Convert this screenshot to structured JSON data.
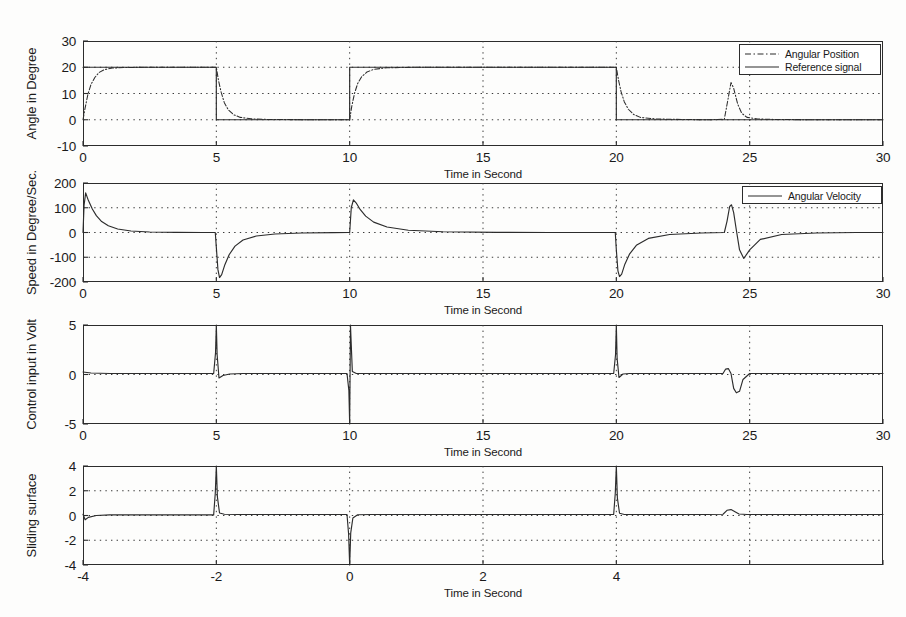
{
  "figure": {
    "background_color": "#fdfdfc",
    "line_color": "#2c2c2c",
    "grid_color": "#3a3a3a"
  },
  "chart_data": [
    {
      "id": "angular-position",
      "type": "line",
      "title": "",
      "xlabel": "Time in Second",
      "ylabel": "Angle in Degree",
      "xlim": [
        0,
        30
      ],
      "ylim": [
        -10,
        30
      ],
      "xticks": [
        0,
        5,
        10,
        15,
        20,
        25,
        30
      ],
      "yticks": [
        -10,
        0,
        10,
        20,
        30
      ],
      "xticklabels": [
        "0",
        "5",
        "10",
        "15",
        "20",
        "25",
        "30"
      ],
      "yticklabels": [
        "-10",
        "0",
        "10",
        "20",
        "30"
      ],
      "grid": true,
      "legend_position": "upper right",
      "series": [
        {
          "name": "Angular Position",
          "style": "dashdot",
          "x": [
            0,
            0.08,
            0.18,
            0.3,
            0.45,
            0.6,
            0.8,
            1.1,
            1.6,
            2.5,
            3.5,
            4.5,
            4.99,
            5.0,
            5.08,
            5.18,
            5.3,
            5.45,
            5.65,
            5.9,
            6.3,
            7.0,
            8.0,
            9.0,
            9.99,
            10.0,
            10.08,
            10.18,
            10.3,
            10.45,
            10.65,
            10.9,
            11.4,
            12.5,
            14.0,
            16.0,
            18.0,
            19.99,
            20.0,
            20.08,
            20.18,
            20.3,
            20.45,
            20.65,
            20.9,
            21.5,
            22.5,
            23.5,
            24.05,
            24.2,
            24.3,
            24.4,
            24.55,
            24.7,
            24.9,
            25.3,
            26.0,
            27.5,
            29.0,
            30.0
          ],
          "y": [
            0,
            4.5,
            9.5,
            13.5,
            16.2,
            18.0,
            19.1,
            19.7,
            19.9,
            20.0,
            20.0,
            20.0,
            20.0,
            20.0,
            15.0,
            10.5,
            6.5,
            3.8,
            1.9,
            0.9,
            0.35,
            0.1,
            0.05,
            0.0,
            0.0,
            0.0,
            5.2,
            10.0,
            13.8,
            16.4,
            18.2,
            19.2,
            19.8,
            20.0,
            20.0,
            20.0,
            20.0,
            20.0,
            20.0,
            15.2,
            10.6,
            6.8,
            4.0,
            2.0,
            0.9,
            0.3,
            0.1,
            0.0,
            0.2,
            8.5,
            14.2,
            12.0,
            6.0,
            2.5,
            0.9,
            0.3,
            0.1,
            0.0,
            0.0,
            0.0
          ]
        },
        {
          "name": "Reference signal",
          "style": "solid",
          "x": [
            0,
            4.999,
            5.0,
            9.999,
            10.0,
            19.999,
            20.0,
            30
          ],
          "y": [
            20,
            20,
            0,
            0,
            20,
            20,
            0,
            0
          ]
        }
      ]
    },
    {
      "id": "angular-velocity",
      "type": "line",
      "title": "",
      "xlabel": "Time in Second",
      "ylabel": "Speed in Degree/Sec.",
      "xlim": [
        0,
        30
      ],
      "ylim": [
        -200,
        200
      ],
      "xticks": [
        0,
        5,
        10,
        15,
        20,
        25,
        30
      ],
      "yticks": [
        -200,
        -100,
        0,
        100,
        200
      ],
      "xticklabels": [
        "0",
        "5",
        "10",
        "15",
        "20",
        "25",
        "30"
      ],
      "yticklabels": [
        "-200",
        "-100",
        "0",
        "100",
        "200"
      ],
      "grid": true,
      "legend_position": "upper right",
      "series": [
        {
          "name": "Angular Velocity",
          "style": "solid",
          "x": [
            0,
            0.04,
            0.1,
            0.2,
            0.35,
            0.5,
            0.7,
            0.95,
            1.3,
            1.8,
            2.5,
            3.5,
            4.5,
            4.96,
            5.0,
            5.06,
            5.12,
            5.2,
            5.32,
            5.48,
            5.7,
            6.0,
            6.5,
            7.2,
            8.2,
            9.4,
            9.96,
            10.0,
            10.06,
            10.14,
            10.24,
            10.4,
            10.6,
            10.9,
            11.4,
            12.2,
            13.5,
            15.5,
            17.5,
            19.5,
            19.96,
            20.0,
            20.06,
            20.12,
            20.2,
            20.32,
            20.5,
            20.75,
            21.2,
            22.0,
            23.2,
            24.05,
            24.15,
            24.25,
            24.32,
            24.4,
            24.5,
            24.62,
            24.78,
            25.0,
            25.4,
            26.2,
            27.5,
            29.0,
            30.0
          ],
          "y": [
            0,
            110,
            160,
            130,
            95,
            68,
            44,
            27,
            14,
            6,
            2,
            0.5,
            0,
            0,
            -60,
            -150,
            -182,
            -170,
            -130,
            -90,
            -55,
            -30,
            -14,
            -6,
            -2,
            -0.5,
            0,
            0,
            100,
            132,
            120,
            92,
            66,
            42,
            22,
            9,
            3,
            0.6,
            0,
            0,
            0,
            -70,
            -155,
            -178,
            -168,
            -128,
            -86,
            -52,
            -24,
            -8,
            -2,
            0,
            45,
            105,
            112,
            80,
            10,
            -70,
            -105,
            -70,
            -28,
            -8,
            -2,
            0,
            0
          ]
        }
      ]
    },
    {
      "id": "control-input",
      "type": "line",
      "title": "",
      "xlabel": "Time in Second",
      "ylabel": "Control input in Volt",
      "xlim": [
        0,
        30
      ],
      "ylim": [
        -5,
        5
      ],
      "xticks": [
        0,
        5,
        10,
        15,
        20,
        25,
        30
      ],
      "yticks": [
        -5,
        0,
        5
      ],
      "xticklabels": [
        "0",
        "5",
        "10",
        "15",
        "20",
        "25",
        "30"
      ],
      "yticklabels": [
        "-5",
        "0",
        "5"
      ],
      "grid": true,
      "legend_position": "none",
      "series": [
        {
          "name": "Control input",
          "style": "solid",
          "x": [
            0,
            0.3,
            1.0,
            2.0,
            3.0,
            4.0,
            4.9,
            4.97,
            5.0,
            5.03,
            5.1,
            5.25,
            5.5,
            6.0,
            7.0,
            8.5,
            9.9,
            9.97,
            10.0,
            10.03,
            10.1,
            10.25,
            10.5,
            11.0,
            12.5,
            15.0,
            17.5,
            19.9,
            19.97,
            20.0,
            20.03,
            20.1,
            20.25,
            20.5,
            21.0,
            22.0,
            23.2,
            24.0,
            24.1,
            24.2,
            24.3,
            24.4,
            24.5,
            24.62,
            24.75,
            25.0,
            25.5,
            26.5,
            28.0,
            30.0
          ],
          "y": [
            0.25,
            0.15,
            0.1,
            0.1,
            0.1,
            0.1,
            0.1,
            2.2,
            5.0,
            2.0,
            -0.35,
            -0.1,
            0.05,
            0.1,
            0.1,
            0.1,
            0.1,
            -1.6,
            -5.0,
            5.0,
            0.3,
            0.1,
            0.1,
            0.1,
            0.1,
            0.1,
            0.1,
            0.1,
            2.0,
            5.0,
            1.6,
            -0.3,
            0.05,
            0.1,
            0.1,
            0.1,
            0.1,
            0.1,
            0.55,
            0.6,
            0.1,
            -1.4,
            -1.85,
            -1.7,
            -0.5,
            0.1,
            0.1,
            0.1,
            0.1,
            0.1
          ]
        }
      ]
    },
    {
      "id": "sliding-surface",
      "type": "line",
      "title": "",
      "xlabel": "Time in Second",
      "ylabel": "Sliding surface",
      "xlim": [
        0,
        30
      ],
      "ylim": [
        -4,
        4
      ],
      "xticks": [
        0,
        5,
        10,
        15,
        20,
        25,
        30
      ],
      "yticks": [
        -4,
        -2,
        0,
        2,
        4
      ],
      "xticklabels": [
        "-4",
        "-2",
        "0",
        "2",
        "4"
      ],
      "yticklabels": [
        "-4",
        "-2",
        "0",
        "2",
        "4"
      ],
      "grid": true,
      "legend_position": "none",
      "series": [
        {
          "name": "Sliding surface",
          "style": "solid",
          "x": [
            0,
            0.08,
            0.2,
            0.5,
            1.0,
            2.0,
            3.0,
            4.0,
            4.9,
            4.96,
            5.0,
            5.04,
            5.12,
            5.3,
            5.8,
            7.0,
            8.5,
            9.9,
            9.96,
            10.0,
            10.04,
            10.12,
            10.3,
            10.8,
            12.0,
            14.0,
            16.0,
            18.0,
            19.9,
            19.96,
            20.0,
            20.04,
            20.12,
            20.3,
            20.8,
            22.0,
            23.4,
            24.0,
            24.15,
            24.3,
            24.45,
            24.6,
            24.9,
            25.5,
            26.5,
            28.0,
            30.0
          ],
          "y": [
            0.1,
            -0.35,
            -0.15,
            0.0,
            0.05,
            0.05,
            0.05,
            0.05,
            0.05,
            1.8,
            4.0,
            1.5,
            0.2,
            0.1,
            0.08,
            0.08,
            0.08,
            0.08,
            -1.5,
            -4.0,
            -1.4,
            -0.2,
            0.06,
            0.08,
            0.08,
            0.08,
            0.08,
            0.08,
            0.08,
            1.8,
            4.0,
            1.4,
            0.18,
            0.08,
            0.08,
            0.08,
            0.08,
            0.1,
            0.42,
            0.48,
            0.3,
            0.12,
            0.08,
            0.08,
            0.08,
            0.08,
            0.08
          ]
        }
      ]
    }
  ]
}
